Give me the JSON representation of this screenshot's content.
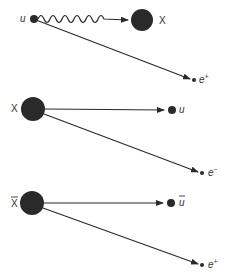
{
  "diagram": {
    "colors": {
      "particle": "#2a2a2a",
      "line": "#2a2a2a",
      "label": "#333333"
    },
    "panels": [
      {
        "id": "panel-1",
        "description": "u quark emits X boson (wavy line), becomes positron",
        "labels": {
          "source": "u",
          "boson": "X",
          "product": "e",
          "product_sup": "+"
        }
      },
      {
        "id": "panel-2",
        "description": "X decays into u and electron",
        "labels": {
          "source": "X",
          "product_a": "u",
          "product_b": "e",
          "product_b_sup": "−"
        }
      },
      {
        "id": "panel-3",
        "description": "anti-X decays into anti-u and positron",
        "labels": {
          "source": "X",
          "product_a": "u",
          "product_b": "e",
          "product_b_sup": "+"
        }
      }
    ]
  }
}
